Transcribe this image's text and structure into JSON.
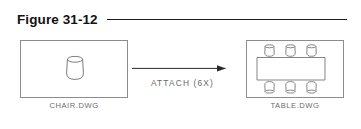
{
  "figure": {
    "title": "Figure 31-12",
    "rule_color": "#1c1c1c"
  },
  "diagram": {
    "type": "flow-diagram",
    "source": {
      "name": "chair-drawing",
      "caption": "CHAIR.DWG",
      "contents": "single chair block, top view",
      "frame_color": "#8d8d8d"
    },
    "operation": {
      "label": "ATTACH (6X)",
      "arrow_direction": "right",
      "arrow_color": "#2a2a2a",
      "count": 6
    },
    "result": {
      "name": "table-drawing",
      "caption": "TABLE.DWG",
      "contents": "rectangular table with six chairs, three per long side",
      "frame_color": "#8d8d8d",
      "chairs_top": 3,
      "chairs_bottom": 3
    },
    "line_color": "#6f6f6f",
    "text_color": "#6d6d6d"
  }
}
